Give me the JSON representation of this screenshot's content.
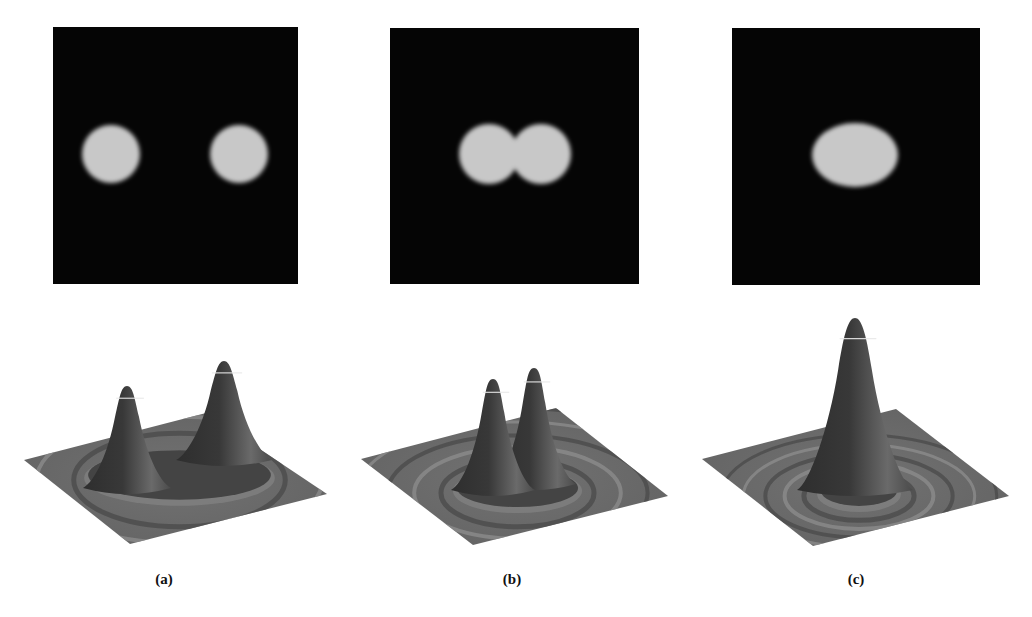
{
  "figure": {
    "panels": [
      {
        "id": "a",
        "caption": "(a)",
        "description": "Two separated circular bright spots",
        "image_box": {
          "x": 53,
          "y": 27,
          "w": 245,
          "h": 257
        },
        "spots": [
          {
            "cx": 111,
            "cy": 154,
            "rx": 29,
            "ry": 29
          },
          {
            "cx": 239,
            "cy": 154,
            "rx": 29,
            "ry": 29
          }
        ],
        "surface": {
          "plane": [
            [
              24,
              460
            ],
            [
              206,
              413
            ],
            [
              327,
              494
            ],
            [
              130,
              544
            ]
          ],
          "peaks": [
            {
              "x": 127,
              "base_y": 488,
              "top_y": 386,
              "half_width": 34
            },
            {
              "x": 224,
              "base_y": 460,
              "top_y": 361,
              "half_width": 38
            }
          ]
        },
        "caption_pos": {
          "x": 164,
          "y": 571
        }
      },
      {
        "id": "b",
        "caption": "(b)",
        "description": "Two overlapping spots forming a peanut shape",
        "image_box": {
          "x": 390,
          "y": 28,
          "w": 249,
          "h": 256
        },
        "spots": [
          {
            "cx": 489,
            "cy": 154,
            "rx": 30,
            "ry": 30
          },
          {
            "cx": 541,
            "cy": 154,
            "rx": 30,
            "ry": 30
          }
        ],
        "surface": {
          "plane": [
            [
              361,
              459
            ],
            [
              556,
              408
            ],
            [
              668,
              496
            ],
            [
              473,
              545
            ]
          ],
          "peaks": [
            {
              "x": 493,
              "base_y": 490,
              "top_y": 379,
              "half_width": 32
            },
            {
              "x": 534,
              "base_y": 484,
              "top_y": 368,
              "half_width": 32
            }
          ]
        },
        "caption_pos": {
          "x": 512,
          "y": 571
        }
      },
      {
        "id": "c",
        "caption": "(c)",
        "description": "Single merged elliptical spot",
        "image_box": {
          "x": 732,
          "y": 28,
          "w": 248,
          "h": 257
        },
        "spots": [
          {
            "cx": 855,
            "cy": 155,
            "rx": 43,
            "ry": 32
          }
        ],
        "surface": {
          "plane": [
            [
              702,
              459
            ],
            [
              896,
              409
            ],
            [
              1009,
              496
            ],
            [
              813,
              546
            ]
          ],
          "peaks": [
            {
              "x": 855,
              "base_y": 490,
              "top_y": 318,
              "half_width": 48
            }
          ]
        },
        "caption_pos": {
          "x": 856,
          "y": 571
        }
      }
    ],
    "colors": {
      "image_bg": "#050505",
      "spot": "#c8c8c8",
      "plane": "#6b6b6b",
      "peak_dark": "#383838",
      "peak_light": "#9a9a9a",
      "ripple_dark": "#4a4a4a",
      "ripple_light": "#8e8e8e"
    }
  }
}
